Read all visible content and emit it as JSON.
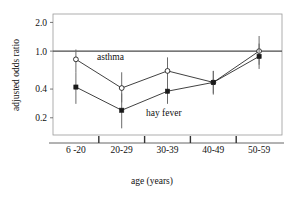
{
  "chart_data": {
    "type": "line",
    "title": "",
    "xlabel": "age (years)",
    "ylabel": "adjusted odds ratio",
    "categories": [
      "6 -20",
      "20-29",
      "30-39",
      "40-49",
      "50-59"
    ],
    "yscale": "log",
    "ylim": [
      0.13,
      2.45
    ],
    "ytick_values": [
      2.0,
      1.0,
      0.4,
      0.2
    ],
    "ytick_labels": [
      "2.0",
      "1.0",
      "0.4",
      "0.2"
    ],
    "grid": false,
    "legend": "inline-annotation",
    "reference_line": {
      "value": 1.0,
      "label": ""
    },
    "series": [
      {
        "name": "asthma",
        "marker": "open-circle",
        "label_text": "asthma",
        "values": [
          0.82,
          0.41,
          0.62,
          0.47,
          1.0
        ],
        "ci_low": [
          0.6,
          0.29,
          0.45,
          0.35,
          0.72
        ],
        "ci_high": [
          1.04,
          0.6,
          0.86,
          0.62,
          1.44
        ]
      },
      {
        "name": "hay fever",
        "marker": "filled-square",
        "label_text": "hay fever",
        "values": [
          0.42,
          0.24,
          0.38,
          0.47,
          0.88
        ],
        "ci_low": [
          0.28,
          0.155,
          0.28,
          0.36,
          0.65
        ],
        "ci_high": [
          0.6,
          0.36,
          0.52,
          0.62,
          1.2
        ]
      }
    ]
  },
  "figure": {
    "axis_label_y": "adjusted odds ratio",
    "axis_label_x": "age (years)"
  }
}
